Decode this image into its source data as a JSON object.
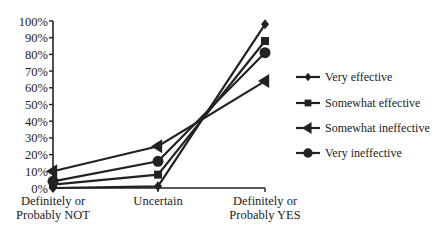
{
  "chart_data": {
    "type": "line",
    "title": "",
    "xlabel": "",
    "ylabel": "",
    "ylim": [
      0,
      100
    ],
    "yticks": [
      "0%",
      "10%",
      "20%",
      "30%",
      "40%",
      "50%",
      "60%",
      "70%",
      "80%",
      "90%",
      "100%"
    ],
    "categories": [
      "Definitely or Probably NOT",
      "Uncertain",
      "Definitely or Probably YES"
    ],
    "category_lines": [
      [
        "Definitely or",
        "Probably NOT"
      ],
      [
        "Uncertain"
      ],
      [
        "Definitely or",
        "Probably YES"
      ]
    ],
    "grid": false,
    "legend_position": "right",
    "series": [
      {
        "name": "Very effective",
        "marker": "diamond",
        "values": [
          0,
          1,
          98
        ]
      },
      {
        "name": "Somewhat effective",
        "marker": "square",
        "values": [
          2,
          8,
          88
        ]
      },
      {
        "name": "Somewhat ineffective",
        "marker": "triangle-left",
        "values": [
          10,
          25,
          64
        ]
      },
      {
        "name": "Very ineffective",
        "marker": "circle",
        "values": [
          4,
          16,
          81
        ]
      }
    ],
    "line_color": "#222222"
  }
}
